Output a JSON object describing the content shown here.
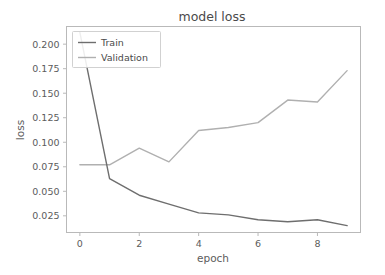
{
  "chart_data": {
    "type": "line",
    "title": "model loss",
    "xlabel": "epoch",
    "ylabel": "loss",
    "x": [
      0,
      1,
      2,
      3,
      4,
      5,
      6,
      7,
      8,
      9
    ],
    "xlim": [
      -0.45,
      9.45
    ],
    "ylim": [
      0.008,
      0.218
    ],
    "xticks": [
      0,
      2,
      4,
      6,
      8
    ],
    "xticklabels": [
      "0",
      "2",
      "4",
      "6",
      "8"
    ],
    "yticks": [
      0.025,
      0.05,
      0.075,
      0.1,
      0.125,
      0.15,
      0.175,
      0.2
    ],
    "yticklabels": [
      "0.025",
      "0.050",
      "0.075",
      "0.100",
      "0.125",
      "0.150",
      "0.175",
      "0.200"
    ],
    "grid": false,
    "legend_position": "upper left",
    "series": [
      {
        "name": "Train",
        "color": "#6e6e6e",
        "values": [
          0.212,
          0.063,
          0.046,
          0.037,
          0.028,
          0.026,
          0.021,
          0.019,
          0.021,
          0.015
        ]
      },
      {
        "name": "Validation",
        "color": "#b0b0b0",
        "values": [
          0.077,
          0.077,
          0.094,
          0.08,
          0.112,
          0.115,
          0.12,
          0.143,
          0.141,
          0.173
        ]
      }
    ]
  },
  "legend": {
    "entries": [
      {
        "label": "Train"
      },
      {
        "label": "Validation"
      }
    ]
  },
  "colors": {
    "train": "#6e6e6e",
    "validation": "#b0b0b0",
    "axis": "#b9b9b9",
    "text": "#5c5c5c",
    "title": "#4a4a4a",
    "background": "#ffffff"
  }
}
